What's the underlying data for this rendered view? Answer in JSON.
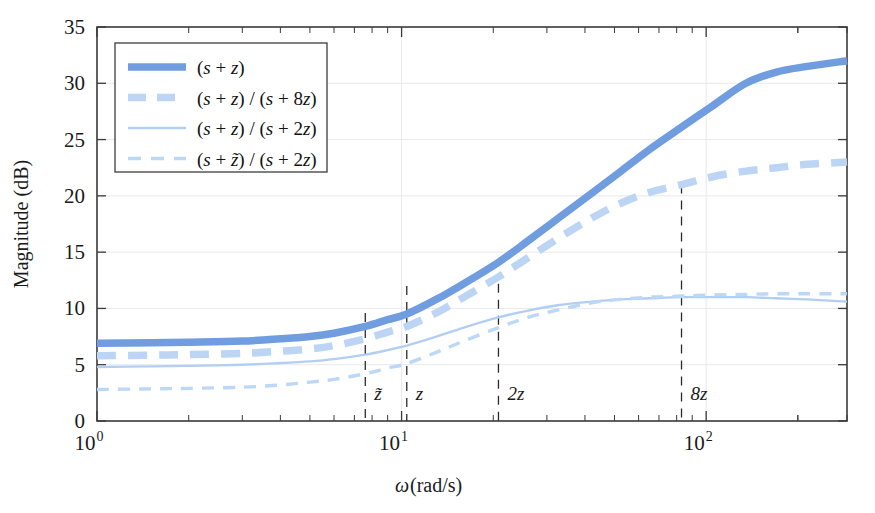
{
  "figure": {
    "background_color": "#ffffff",
    "frame_color": "#3a3a3a"
  },
  "axes": {
    "x_title_symbol": "ω",
    "x_title_unit": " (rad/s)",
    "y_title": "Magnitude (dB)",
    "y_ticks": [
      "0",
      "5",
      "10",
      "15",
      "20",
      "25",
      "30",
      "35"
    ],
    "y_tick_values": [
      0,
      5,
      10,
      15,
      20,
      25,
      30,
      35
    ],
    "x_tick_labels": [
      {
        "mantissa": "10",
        "exponent": "0",
        "value": 1
      },
      {
        "mantissa": "10",
        "exponent": "1",
        "value": 10
      },
      {
        "mantissa": "10",
        "exponent": "2",
        "value": 100
      }
    ],
    "x_scale": "log",
    "xlim": [
      1,
      290
    ],
    "ylim": [
      0,
      35
    ],
    "grid": true
  },
  "markers": [
    {
      "label": "~z",
      "display": "z̃",
      "value": 7.6,
      "top_db": 9.6
    },
    {
      "label": "z",
      "display": "z",
      "value": 10.4,
      "top_db": 12.0
    },
    {
      "label": "2z",
      "display": "2z",
      "value": 20.8,
      "top_db": 12.2
    },
    {
      "label": "8z",
      "display": "8z",
      "value": 83.0,
      "top_db": 21.0
    }
  ],
  "legend": {
    "position": "upper-left",
    "entries": [
      {
        "id": "s-plus-z",
        "text": "(s + z)",
        "color": "#6f9de0",
        "width": 7.5,
        "dash": "none"
      },
      {
        "id": "s-plus-z-over-s-plus-8z",
        "text": "(s + z) / (s + 8z)",
        "color": "#bcd5f4",
        "width": 7.5,
        "dash": "18 11"
      },
      {
        "id": "s-plus-z-over-s-plus-2z",
        "text": "(s + z) / (s + 2z)",
        "color": "#b2cef4",
        "width": 2.4,
        "dash": "none"
      },
      {
        "id": "s-plus-ztilde-over-s-plus-2z",
        "text": "(s + z̃) / (s + 2z)",
        "color": "#bcd8f7",
        "width": 3.4,
        "dash": "13 10"
      }
    ]
  },
  "chart_data": {
    "type": "line",
    "title": "",
    "xlabel": "ω (rad/s)",
    "ylabel": "Magnitude (dB)",
    "xscale": "log",
    "xlim": [
      1,
      290
    ],
    "ylim": [
      0,
      35
    ],
    "grid": true,
    "legend_position": "upper left",
    "annotations": [
      {
        "text": "z̃",
        "x": 7.6
      },
      {
        "text": "z",
        "x": 10.4
      },
      {
        "text": "2z",
        "x": 20.8
      },
      {
        "text": "8z",
        "x": 83.0
      }
    ],
    "x": [
      1,
      1.5,
      2,
      3,
      4,
      5,
      6,
      7.6,
      9,
      10.4,
      13,
      16,
      20.8,
      26,
      33,
      42,
      52,
      65,
      83,
      105,
      135,
      170,
      215,
      290
    ],
    "series": [
      {
        "name": "(s + z)",
        "color": "#6f9de0",
        "style": "solid",
        "linewidth": 7.5,
        "values": [
          6.9,
          6.95,
          7.0,
          7.1,
          7.3,
          7.5,
          7.8,
          8.4,
          9.0,
          9.5,
          10.8,
          12.2,
          14.1,
          16.0,
          18.1,
          20.2,
          22.1,
          24.1,
          26.1,
          28.0,
          30.0,
          31.0,
          31.5,
          32.0
        ]
      },
      {
        "name": "(s + z) / (s + 8z)",
        "color": "#bcd5f4",
        "style": "dashed",
        "linewidth": 7.5,
        "values": [
          5.8,
          5.85,
          5.9,
          6.0,
          6.2,
          6.4,
          6.7,
          7.3,
          7.9,
          8.4,
          9.6,
          11.0,
          12.8,
          14.5,
          16.3,
          18.0,
          19.3,
          20.3,
          21.0,
          21.7,
          22.2,
          22.5,
          22.8,
          23.0
        ]
      },
      {
        "name": "(s + z) / (s + 2z)",
        "color": "#b2cef4",
        "style": "solid",
        "linewidth": 2.4,
        "values": [
          4.8,
          4.85,
          4.9,
          5.0,
          5.15,
          5.3,
          5.5,
          5.9,
          6.3,
          6.7,
          7.5,
          8.3,
          9.2,
          9.8,
          10.3,
          10.6,
          10.8,
          10.9,
          11.0,
          11.0,
          11.0,
          10.9,
          10.8,
          10.6
        ]
      },
      {
        "name": "(s + z̃) / (s + 2z)",
        "color": "#bcd8f7",
        "style": "dashed",
        "linewidth": 3.4,
        "values": [
          2.8,
          2.85,
          2.9,
          3.0,
          3.2,
          3.45,
          3.7,
          4.2,
          4.7,
          5.1,
          6.1,
          7.1,
          8.3,
          9.2,
          9.9,
          10.5,
          10.8,
          11.0,
          11.1,
          11.2,
          11.25,
          11.3,
          11.3,
          11.3
        ]
      }
    ]
  }
}
